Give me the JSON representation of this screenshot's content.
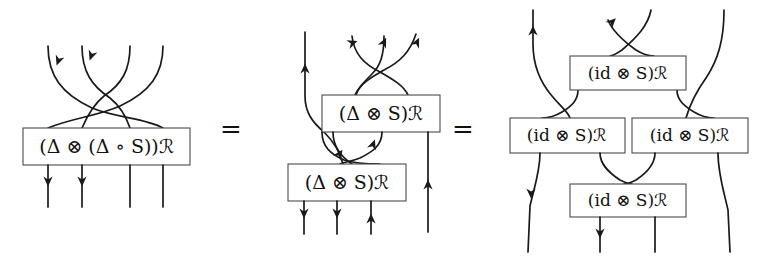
{
  "figure": {
    "kind": "string-diagram-equation",
    "background_color": "#ffffff",
    "line_color": "#1a1a1a",
    "box_border_color": "#4a4a4a",
    "box_fill_color": "#ffffff",
    "equals_signs": [
      "=",
      "="
    ]
  },
  "panels": [
    {
      "id": "panel-1",
      "boxes": [
        {
          "id": "p1-box-1",
          "label": "(Δ ⊗ (Δ ∘ S))ℛ"
        }
      ],
      "wire_count_top": 4,
      "wire_count_bottom": 4
    },
    {
      "id": "panel-2",
      "boxes": [
        {
          "id": "p2-box-top",
          "label": "(Δ ⊗ S)ℛ"
        },
        {
          "id": "p2-box-bottom",
          "label": "(Δ ⊗ S)ℛ"
        }
      ],
      "wire_count_top": 4,
      "wire_count_bottom": 4
    },
    {
      "id": "panel-3",
      "boxes": [
        {
          "id": "p3-box-top",
          "label": "(id ⊗ S)ℛ"
        },
        {
          "id": "p3-box-mid-left",
          "label": "(id ⊗ S)ℛ"
        },
        {
          "id": "p3-box-mid-right",
          "label": "(id ⊗ S)ℛ"
        },
        {
          "id": "p3-box-bottom",
          "label": "(id ⊗ S)ℛ"
        }
      ],
      "wire_count_top": 4,
      "wire_count_bottom": 4
    }
  ]
}
